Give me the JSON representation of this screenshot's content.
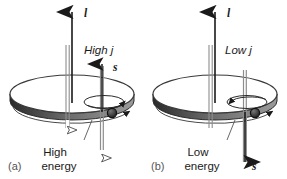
{
  "figure": {
    "background_color": "#ffffff",
    "ink_color": "#1a1a1a",
    "shaft_color": "#6e6e6e",
    "rim_color": "#4a4a4a",
    "disk_fill": "#ffffff"
  },
  "panels": [
    {
      "id": "a",
      "caption": "(a)",
      "orbital_vector_label": "l",
      "j_label": "High j",
      "spin_vector_label": "s",
      "energy_label_line1": "High",
      "energy_label_line2": "energy",
      "j_arrow_direction": "down",
      "j_arrow_style": "hollow",
      "spin_arrow_direction": "up",
      "spin_arrow_style": "solid",
      "energy_arrow_direction": "down",
      "energy_arrow_style": "hollow"
    },
    {
      "id": "b",
      "caption": "(b)",
      "orbital_vector_label": "l",
      "j_label": "Low j",
      "spin_vector_label": "s",
      "energy_label_line1": "Low",
      "energy_label_line2": "energy",
      "j_arrow_direction": "up",
      "j_arrow_style": "hollow",
      "spin_arrow_direction": "down",
      "spin_arrow_style": "solid",
      "energy_arrow_direction": "down",
      "energy_arrow_style": "hollow"
    }
  ]
}
